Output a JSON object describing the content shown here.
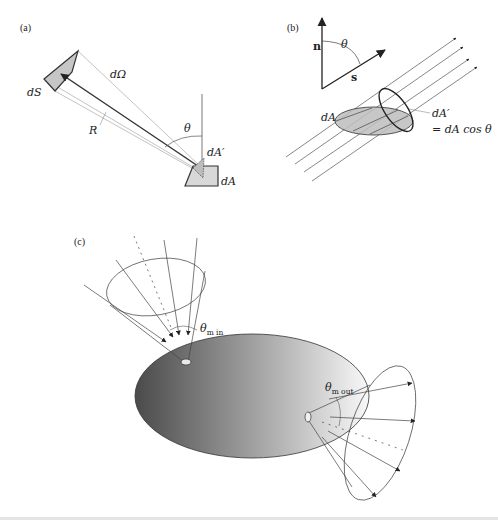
{
  "figure": {
    "panels": {
      "a": {
        "label": "(a)",
        "labels": {
          "solid_angle": "dΩ",
          "source_area": "dS",
          "distance": "R",
          "angle": "θ",
          "projected_area": "dA′",
          "area": "dA"
        }
      },
      "b": {
        "label": "(b)",
        "labels": {
          "normal": "n",
          "direction": "s",
          "angle": "θ",
          "area": "dA",
          "projected_area": "dA′",
          "relation": "= dA cos θ"
        }
      },
      "c": {
        "label": "(c)",
        "labels": {
          "theta_in_symbol": "θ",
          "theta_in_sub": "m in",
          "theta_out_symbol": "θ",
          "theta_out_sub": "m out"
        }
      }
    },
    "colors": {
      "line": "#333333",
      "thin_line": "#777777",
      "fill_gray": "#c8c8c8",
      "ellipse_dark": "#555555",
      "ellipse_light": "#f2f2f2"
    }
  }
}
